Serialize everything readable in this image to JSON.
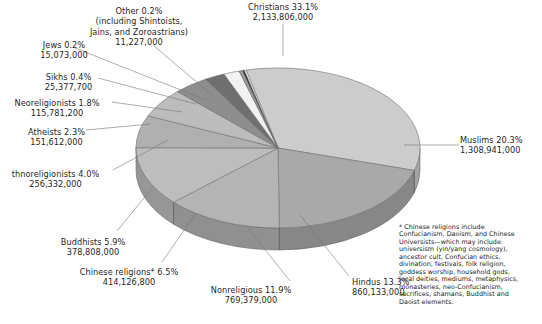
{
  "chart_data": {
    "type": "pie",
    "title": "",
    "subtitle": "",
    "xlabel": "",
    "ylabel": "",
    "legend_position": "none",
    "grid": false,
    "style": "3d-exploded-none",
    "total_label": "",
    "categories": [
      "Christians",
      "Muslims",
      "Hindus",
      "Nonreligious",
      "Chinese religions*",
      "Buddhists",
      "Ethnoreligionists",
      "Atheists",
      "Neoreligionists",
      "Sikhs",
      "Jews",
      "Other"
    ],
    "values": [
      33.1,
      20.3,
      13.3,
      11.9,
      6.5,
      5.9,
      4.0,
      2.3,
      1.8,
      0.4,
      0.2,
      0.2
    ],
    "counts": [
      2133806000,
      1308941000,
      860133000,
      769379000,
      414126800,
      378808000,
      256332000,
      151612000,
      115781200,
      25377700,
      15073000,
      11227000
    ],
    "count_labels": [
      "2,133,806,000",
      "1,308,941,000",
      "860,133,000",
      "769,379,000",
      "414,126,800",
      "378,808,000",
      "256,332,000",
      "151,612,000",
      "115,781,200",
      "25,377,700",
      "15,073,000",
      "11,227,000"
    ],
    "percent_labels": [
      "33.1%",
      "20.3%",
      "13.3%",
      "11.9%",
      "6.5%",
      "5.9%",
      "4.0%",
      "2.3%",
      "1.8%",
      "0.4%",
      "0.2%",
      "0.2%"
    ],
    "slice_colors": [
      "#cccccc",
      "#a9a9a9",
      "#b4b4b4",
      "#bdbdbd",
      "#b0b0b0",
      "#bcbcbc",
      "#8e8e8e",
      "#6f6f6f",
      "#f2f2f2",
      "#9a9a9a",
      "#1a1a1a",
      "#fbfbfb"
    ]
  },
  "labels": {
    "christians": {
      "l1": "Christians 33.1%",
      "l2": "2,133,806,000"
    },
    "muslims": {
      "l1": "Muslims 20.3%",
      "l2": "1,308,941,000"
    },
    "hindus": {
      "l1": "Hindus 13.3%",
      "l2": "860,133,000"
    },
    "nonreligious": {
      "l1": "Nonreligious 11.9%",
      "l2": "769,379,000"
    },
    "chinese_religions": {
      "l1": "Chinese religions* 6.5%",
      "l2": "414,126,800"
    },
    "buddhists": {
      "l1": "Buddhists 5.9%",
      "l2": "378,808,000"
    },
    "ethnoreligionists": {
      "l1": "thnoreligionists 4.0%",
      "l2": "256,332,000"
    },
    "atheists": {
      "l1": "Atheists 2.3%",
      "l2": "151,612,000"
    },
    "neoreligionists": {
      "l1": "Neoreligionists 1.8%",
      "l2": "115,781,200"
    },
    "sikhs": {
      "l1": "Sikhs 0.4%",
      "l2": "25,377,700"
    },
    "jews": {
      "l1": "Jews 0.2%",
      "l2": "15,073,000"
    },
    "other": {
      "l1": "Other 0.2%",
      "l2": "(including Shintoists,",
      "l3": "Jains, and Zoroastrians)",
      "l4": "11,227,000"
    }
  },
  "footnote": {
    "lines": [
      "* Chinese religions include",
      "Confucianism, Daoism, and Chinese",
      "Universists—which may include:",
      "universism (yin/yang cosmology),",
      "ancestor cult, Confucian ethics,",
      "divination, festivals, folk religion,",
      "goddess worship, household gods,",
      "local deities, mediums, metaphysics,",
      "monasteries, neo-Confucianism,",
      "sacrifices, shamans, Buddhist and",
      "Daoist elements."
    ]
  }
}
